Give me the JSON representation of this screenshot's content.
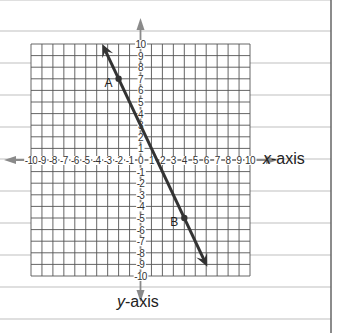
{
  "chart_data": {
    "type": "line",
    "title": "",
    "xlabel": "x-axis",
    "ylabel": "y-axis",
    "xlim": [
      -10,
      10
    ],
    "ylim": [
      -10,
      10
    ],
    "grid": true,
    "x_ticks": [
      -10,
      -9,
      -8,
      -7,
      -6,
      -5,
      -4,
      -3,
      -2,
      -1,
      0,
      1,
      2,
      3,
      4,
      5,
      6,
      7,
      8,
      9,
      10
    ],
    "y_ticks": [
      -10,
      -9,
      -8,
      -7,
      -6,
      -5,
      -4,
      -3,
      -2,
      -1,
      1,
      2,
      3,
      4,
      5,
      6,
      7,
      8,
      9,
      10
    ],
    "line": {
      "equation": "y = -2x + 3",
      "slope": -2,
      "intercept": 3,
      "from": {
        "x": -3.5,
        "y": 10
      },
      "to": {
        "x": 6.1,
        "y": -9.2
      },
      "arrows": "both"
    },
    "points": [
      {
        "label": "A",
        "x": -2,
        "y": 7
      },
      {
        "label": "B",
        "x": 4,
        "y": -5
      }
    ]
  },
  "labels": {
    "x_axis": "x-axis",
    "y_axis": "y-axis",
    "x_var": "x",
    "y_var": "y",
    "suffix": "-axis"
  },
  "colors": {
    "grid": "#555555",
    "axis": "#8a8a8a",
    "line": "#333333",
    "ruled": "#bfbfbf",
    "border": "#666666"
  }
}
